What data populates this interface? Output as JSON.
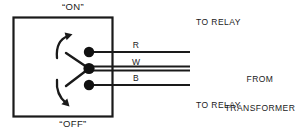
{
  "diagram": {
    "switch_box": {
      "on_label": "“ON”",
      "off_label": "“OFF”",
      "border_color": "#1a1a1a"
    },
    "terminals": [
      {
        "code": "R",
        "name": "red-terminal",
        "color": "#111111"
      },
      {
        "code": "W",
        "name": "white-terminal",
        "color": "#111111"
      },
      {
        "code": "B",
        "name": "black-terminal",
        "color": "#111111"
      }
    ],
    "wires": [
      {
        "code": "R",
        "destination": "TO RELAY"
      },
      {
        "code": "W",
        "destination": "FROM TRANSFORMER"
      },
      {
        "code": "B",
        "destination": "TO RELAY"
      }
    ],
    "callouts": {
      "relay_top": "TO RELAY",
      "relay_bottom": "TO RELAY",
      "transformer_line1": "FROM",
      "transformer_line2": "TRANSFORMER"
    },
    "colors": {
      "ink": "#1a1a1a",
      "background": "#ffffff"
    }
  }
}
